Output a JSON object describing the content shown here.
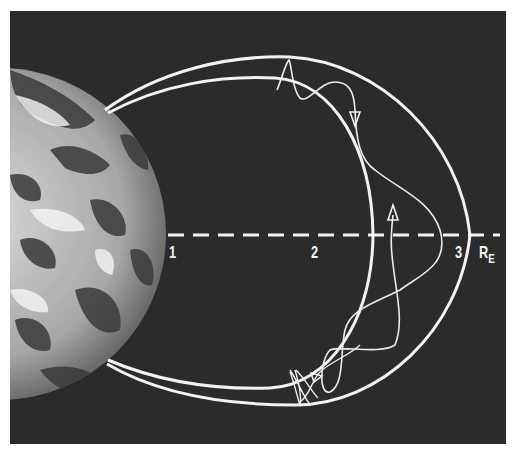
{
  "figure": {
    "background_color": "#2a2a2a",
    "line_color": "#f2f2f2",
    "axis": {
      "unit_label": "R",
      "unit_subscript": "E",
      "ticks": [
        {
          "value": "1",
          "x": 172
        },
        {
          "value": "2",
          "x": 314
        },
        {
          "value": "3",
          "x": 458
        }
      ]
    },
    "elements": {
      "earth": "earth-globe",
      "field_line_outer": "outer-magnetic-field-line",
      "field_line_inner": "inner-magnetic-field-line",
      "trajectory": "particle-trajectory",
      "equator": "dashed-equatorial-axis"
    }
  }
}
